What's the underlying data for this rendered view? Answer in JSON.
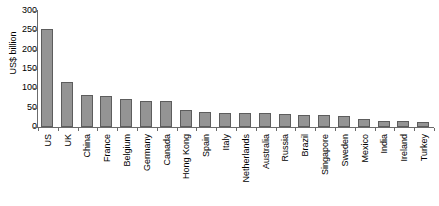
{
  "chart_data": {
    "type": "bar",
    "title": "",
    "subtitle": "",
    "xlabel": "",
    "ylabel": "US$ billion",
    "ylim": [
      0,
      300
    ],
    "ytick_step": 50,
    "yticks": [
      0,
      50,
      100,
      150,
      200,
      250,
      300
    ],
    "ytick_labels": [
      "0",
      "50",
      "100",
      "150",
      "200",
      "250",
      "300"
    ],
    "grid": false,
    "legend": false,
    "legend_position": "none",
    "bar_color": "#949494",
    "bar_edge_color": "#5d5d5d",
    "axis_color": "#6b6b6b",
    "categories": [
      "US",
      "UK",
      "China",
      "France",
      "Belgium",
      "Germany",
      "Canada",
      "Hong Kong",
      "Spain",
      "Italy",
      "Netherlands",
      "Australia",
      "Russia",
      "Brazil",
      "Singapore",
      "Sweden",
      "Mexico",
      "India",
      "Ireland",
      "Turkey"
    ],
    "values": [
      254,
      116,
      84,
      79,
      73,
      68,
      66,
      43,
      40,
      37,
      36,
      36,
      34,
      31,
      31,
      29,
      20,
      16,
      15,
      14
    ],
    "series": [
      {
        "name": "",
        "values": [
          254,
          116,
          84,
          79,
          73,
          68,
          66,
          43,
          40,
          37,
          36,
          36,
          34,
          31,
          31,
          29,
          20,
          16,
          15,
          14
        ]
      }
    ]
  }
}
